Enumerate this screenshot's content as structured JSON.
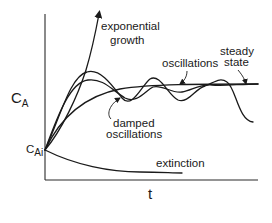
{
  "diagram": {
    "type": "concentration-vs-time behaviors",
    "axes": {
      "y_label_main": "C",
      "y_label_sub": "A",
      "x_label": "t",
      "initial_value_main": "C",
      "initial_value_sub": "Ai"
    },
    "curves": [
      {
        "id": "exponential-growth",
        "label_line1": "exponential",
        "label_line2": "growth"
      },
      {
        "id": "oscillations",
        "label": "oscillations"
      },
      {
        "id": "steady-state",
        "label_line1": "steady",
        "label_line2": "state"
      },
      {
        "id": "damped-oscillations",
        "label_line1": "damped",
        "label_line2": "oscillations"
      },
      {
        "id": "extinction",
        "label": "extinction"
      }
    ],
    "colors": {
      "stroke": "#1a1a1a",
      "background": "#ffffff"
    }
  }
}
